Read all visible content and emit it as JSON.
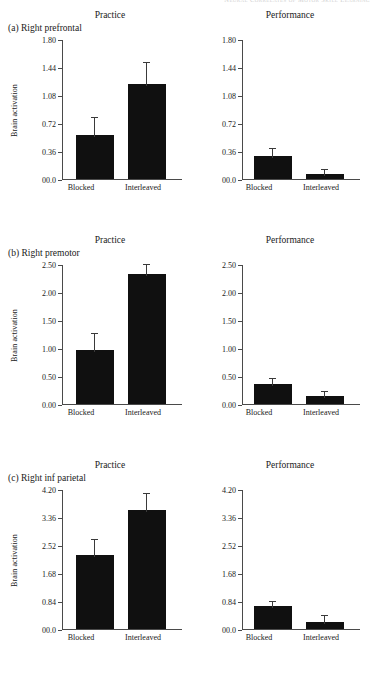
{
  "running_header": "Neural Correlates of Motor Skill Learning",
  "figure": {
    "column_titles": {
      "practice": "Practice",
      "performance": "Performance"
    },
    "x_categories": [
      "Blocked",
      "Interleaved"
    ],
    "y_axis_label": "Brain activation",
    "panels": [
      {
        "id": "a",
        "label": "(a) Right prefrontal",
        "ticks": [
          "1.80",
          "1.44",
          "1.08",
          "0.72",
          "0.36",
          "00.0"
        ]
      },
      {
        "id": "b",
        "label": "(b) Right premotor",
        "ticks": [
          "2.50",
          "2.00",
          "1.50",
          "1.00",
          "0.50",
          "0.00"
        ]
      },
      {
        "id": "c",
        "label": "(c) Right inf parietal",
        "ticks": [
          "4.20",
          "3.36",
          "2.52",
          "1.68",
          "0.84",
          "00.0"
        ]
      }
    ]
  },
  "chart_data": [
    {
      "type": "bar",
      "title": "Practice",
      "panel": "(a) Right prefrontal",
      "categories": [
        "Blocked",
        "Interleaved"
      ],
      "values": [
        0.57,
        1.22
      ],
      "errors_upper": [
        0.79,
        1.49
      ],
      "xlabel": "",
      "ylabel": "Brain activation",
      "ylim": [
        0.0,
        1.8
      ],
      "yticks": [
        0.0,
        0.36,
        0.72,
        1.08,
        1.44,
        1.8
      ],
      "ytick_labels": [
        "00.0",
        "0.36",
        "0.72",
        "1.08",
        "1.44",
        "1.80"
      ],
      "grid": false,
      "legend": "none"
    },
    {
      "type": "bar",
      "title": "Performance",
      "panel": "(a) Right prefrontal",
      "categories": [
        "Blocked",
        "Interleaved"
      ],
      "values": [
        0.3,
        0.06
      ],
      "errors_upper": [
        0.38,
        0.12
      ],
      "xlabel": "",
      "ylabel": "",
      "ylim": [
        0.0,
        1.8
      ],
      "yticks": [
        0.0,
        0.36,
        0.72,
        1.08,
        1.44,
        1.8
      ],
      "ytick_labels": [
        "00.0",
        "0.36",
        "0.72",
        "1.08",
        "1.44",
        "1.80"
      ],
      "grid": false,
      "legend": "none"
    },
    {
      "type": "bar",
      "title": "Practice",
      "panel": "(b) Right premotor",
      "categories": [
        "Blocked",
        "Interleaved"
      ],
      "values": [
        0.97,
        2.32
      ],
      "errors_upper": [
        1.25,
        2.48
      ],
      "xlabel": "",
      "ylabel": "Brain activation",
      "ylim": [
        0.0,
        2.5
      ],
      "yticks": [
        0.0,
        0.5,
        1.0,
        1.5,
        2.0,
        2.5
      ],
      "ytick_labels": [
        "0.00",
        "0.50",
        "1.00",
        "1.50",
        "2.00",
        "2.50"
      ],
      "grid": false,
      "legend": "none"
    },
    {
      "type": "bar",
      "title": "Performance",
      "panel": "(b) Right premotor",
      "categories": [
        "Blocked",
        "Interleaved"
      ],
      "values": [
        0.35,
        0.14
      ],
      "errors_upper": [
        0.44,
        0.22
      ],
      "xlabel": "",
      "ylabel": "",
      "ylim": [
        0.0,
        2.5
      ],
      "yticks": [
        0.0,
        0.5,
        1.0,
        1.5,
        2.0,
        2.5
      ],
      "ytick_labels": [
        "0.00",
        "0.50",
        "1.00",
        "1.50",
        "2.00",
        "2.50"
      ],
      "grid": false,
      "legend": "none"
    },
    {
      "type": "bar",
      "title": "Practice",
      "panel": "(c) Right inf parietal",
      "categories": [
        "Blocked",
        "Interleaved"
      ],
      "values": [
        2.21,
        3.57
      ],
      "errors_upper": [
        2.68,
        4.06
      ],
      "xlabel": "",
      "ylabel": "Brain activation",
      "ylim": [
        0.0,
        4.2
      ],
      "yticks": [
        0.0,
        0.84,
        1.68,
        2.52,
        3.36,
        4.2
      ],
      "ytick_labels": [
        "00.0",
        "0.84",
        "1.68",
        "2.52",
        "3.36",
        "4.20"
      ],
      "grid": false,
      "legend": "none"
    },
    {
      "type": "bar",
      "title": "Performance",
      "panel": "(c) Right inf parietal",
      "categories": [
        "Blocked",
        "Interleaved"
      ],
      "values": [
        0.68,
        0.21
      ],
      "errors_upper": [
        0.82,
        0.38
      ],
      "xlabel": "",
      "ylabel": "",
      "ylim": [
        0.0,
        4.2
      ],
      "yticks": [
        0.0,
        0.84,
        1.68,
        2.52,
        3.36,
        4.2
      ],
      "ytick_labels": [
        "00.0",
        "0.84",
        "1.68",
        "2.52",
        "3.36",
        "4.20"
      ],
      "grid": false,
      "legend": "none"
    }
  ]
}
